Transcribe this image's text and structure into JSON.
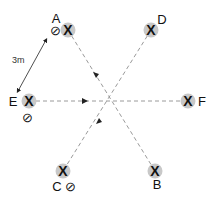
{
  "diagram": {
    "center": {
      "x": 110,
      "y": 101
    },
    "line_color": "#9a9a9a",
    "node_fill": "#c8c8c8",
    "nodes": [
      {
        "id": "A",
        "label": "A",
        "x": 68,
        "y": 30,
        "label_x": 56,
        "label_y": 23,
        "marker": "X",
        "null_symbol": "⊘",
        "null_x": 55,
        "null_y": 35
      },
      {
        "id": "D",
        "label": "D",
        "x": 151,
        "y": 30,
        "label_x": 162,
        "label_y": 24,
        "marker": "X"
      },
      {
        "id": "E",
        "label": "E",
        "x": 29,
        "y": 101,
        "label_x": 13,
        "label_y": 106,
        "marker": "X",
        "null_symbol": "⊘",
        "null_x": 27,
        "null_y": 122
      },
      {
        "id": "F",
        "label": "F",
        "x": 188,
        "y": 101,
        "label_x": 202,
        "label_y": 106,
        "marker": "X"
      },
      {
        "id": "C",
        "label": "C",
        "x": 63,
        "y": 171,
        "label_x": 57,
        "label_y": 191,
        "marker": "X",
        "null_symbol": "⊘",
        "null_x": 70,
        "null_y": 191
      },
      {
        "id": "B",
        "label": "B",
        "x": 155,
        "y": 171,
        "label_x": 157,
        "label_y": 189,
        "marker": "X"
      }
    ],
    "dimension": {
      "label": "3m",
      "from": {
        "x": 46,
        "y": 40
      },
      "to": {
        "x": 18,
        "y": 91
      },
      "label_x": 12,
      "label_y": 63
    }
  }
}
